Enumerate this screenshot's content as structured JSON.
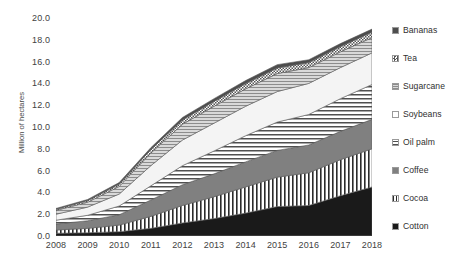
{
  "chart_data": {
    "type": "area",
    "stacked": true,
    "title": "",
    "subtitle": "",
    "xlabel": "",
    "ylabel": "Million of hectares",
    "categories": [
      2008,
      2009,
      2010,
      2011,
      2012,
      2013,
      2014,
      2015,
      2016,
      2017,
      2018
    ],
    "xtick_labels": [
      "2008",
      "2009",
      "2010",
      "2011",
      "2012",
      "2013",
      "2014",
      "2015",
      "2016",
      "2017",
      "2018"
    ],
    "ytick_labels": [
      "0.0",
      "2.0",
      "4.0",
      "6.0",
      "8.0",
      "10.0",
      "12.0",
      "14.0",
      "16.0",
      "18.0",
      "20.0"
    ],
    "ytick_values": [
      0.0,
      2.0,
      4.0,
      6.0,
      8.0,
      10.0,
      12.0,
      14.0,
      16.0,
      18.0,
      20.0
    ],
    "ylim": [
      0.0,
      20.0
    ],
    "grid": false,
    "legend_position": "right",
    "series": [
      {
        "name": "Cotton",
        "order": 1,
        "fill": "solid-black",
        "color": "#1a1a1a",
        "values": [
          0.25,
          0.3,
          0.4,
          0.7,
          1.2,
          1.6,
          2.1,
          2.7,
          2.8,
          3.7,
          4.5
        ]
      },
      {
        "name": "Cocoa",
        "order": 2,
        "fill": "vertical-lines",
        "color": "#ffffff",
        "values": [
          0.3,
          0.4,
          0.6,
          1.1,
          1.6,
          2.0,
          2.4,
          2.7,
          3.0,
          3.3,
          3.5
        ]
      },
      {
        "name": "Coffee",
        "order": 3,
        "fill": "solid-midgray",
        "color": "#808080",
        "values": [
          0.55,
          0.7,
          0.95,
          1.5,
          1.9,
          2.1,
          2.3,
          2.45,
          2.55,
          2.6,
          2.7
        ]
      },
      {
        "name": "Oil palm",
        "order": 4,
        "fill": "horizontal-lines",
        "color": "#c9c9c9",
        "values": [
          0.35,
          0.5,
          0.8,
          1.3,
          1.75,
          2.1,
          2.4,
          2.6,
          2.8,
          3.0,
          3.2
        ]
      },
      {
        "name": "Soybeans",
        "order": 5,
        "fill": "white-blank",
        "color": "#f4f4f4",
        "values": [
          0.55,
          0.75,
          1.1,
          1.85,
          2.35,
          2.55,
          2.7,
          2.8,
          2.85,
          2.85,
          2.9
        ]
      },
      {
        "name": "Sugarcane",
        "order": 6,
        "fill": "fine-horizontal",
        "color": "#b5b5b5",
        "values": [
          0.35,
          0.45,
          0.7,
          1.15,
          1.45,
          1.55,
          1.6,
          1.65,
          1.45,
          1.45,
          1.4
        ]
      },
      {
        "name": "Tea",
        "order": 7,
        "fill": "checker-dots",
        "color": "#e0e0e0",
        "values": [
          0.1,
          0.15,
          0.22,
          0.32,
          0.4,
          0.45,
          0.48,
          0.52,
          0.46,
          0.48,
          0.5
        ]
      },
      {
        "name": "Bananas",
        "order": 8,
        "fill": "solid-darkgray",
        "color": "#4d4d4d",
        "values": [
          0.08,
          0.1,
          0.13,
          0.18,
          0.22,
          0.25,
          0.28,
          0.3,
          0.26,
          0.27,
          0.28
        ]
      }
    ],
    "totals": [
      2.53,
      3.35,
      4.9,
      8.1,
      10.87,
      12.6,
      14.26,
      15.72,
      16.17,
      17.65,
      18.98
    ]
  },
  "legend": {
    "items": [
      {
        "label": "Bananas",
        "swatch": "solid-darkgray"
      },
      {
        "label": "Tea",
        "swatch": "checker-dots"
      },
      {
        "label": "Sugarcane",
        "swatch": "fine-horizontal"
      },
      {
        "label": "Soybeans",
        "swatch": "white-blank"
      },
      {
        "label": "Oil palm",
        "swatch": "horizontal-lines"
      },
      {
        "label": "Coffee",
        "swatch": "solid-midgray"
      },
      {
        "label": "Cocoa",
        "swatch": "vertical-lines"
      },
      {
        "label": "Cotton",
        "swatch": "solid-black"
      }
    ]
  }
}
